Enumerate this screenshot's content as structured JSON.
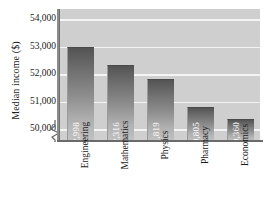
{
  "chart_data": {
    "type": "bar",
    "title": "",
    "xlabel": "",
    "ylabel": "Median income ($)",
    "categories": [
      "Engineering",
      "Mathematics",
      "Physics",
      "Pharmacy",
      "Economics"
    ],
    "values": [
      52998,
      52316,
      51819,
      50805,
      50360
    ],
    "value_labels": [
      "52,998",
      "52,316",
      "51,819",
      "50,805",
      "50,360"
    ],
    "ytick_labels": [
      "50,000",
      "51,000",
      "52,000",
      "53,000",
      "54,000"
    ],
    "ytick_values": [
      50000,
      51000,
      52000,
      53000,
      54000
    ],
    "ylim": [
      49600,
      54400
    ],
    "axis_break": true,
    "grid": true,
    "legend": false,
    "colors": {
      "plot_background": "#cfcfcf",
      "gridline": "#f4f4f4",
      "bar_top": "#545454",
      "bar_bottom": "#c2c2c2",
      "axis": "#6b6b6b",
      "text": "#1a1a1a",
      "value_label_text": "#ffffff"
    }
  }
}
